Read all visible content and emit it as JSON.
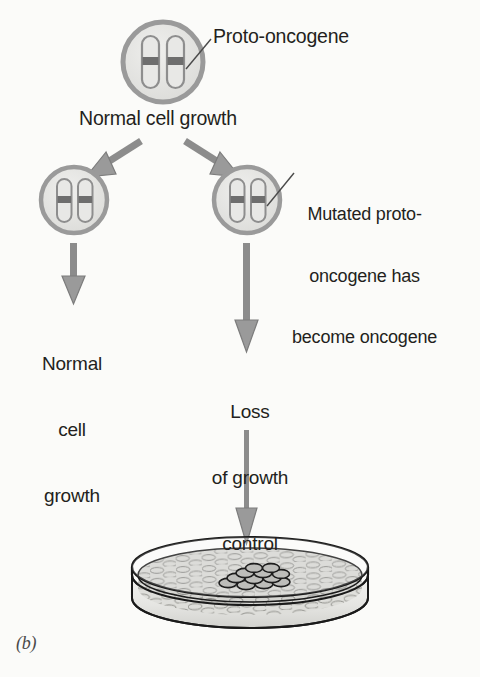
{
  "figure": {
    "panel_letter": "(b)",
    "background_color": "#fbfbf9",
    "text_color": "#231f20",
    "arrow_color": "#8b8b8b",
    "cell_membrane_color": "#9a9a9a",
    "cell_interior_color": "#e3e3e1",
    "chromosome_outline_color": "#8e8e8e",
    "gene_band_color": "#6e6e6e",
    "dish_outline_color": "#1a1a1a",
    "dish_fill_color": "#d7d7d4",
    "focus_cell_color": "#2b2b2b"
  },
  "labels": {
    "proto_oncogene": "Proto-oncogene",
    "normal_cell_growth": "Normal cell growth",
    "mutated_line1": "Mutated proto-",
    "mutated_line2": "oncogene has",
    "mutated_line3": "become oncogene",
    "left_outcome_line1": "Normal",
    "left_outcome_line2": "cell",
    "left_outcome_line3": "growth",
    "right_outcome_line1": "Loss",
    "right_outcome_line2": "of growth",
    "right_outcome_line3": "control"
  },
  "cells": {
    "top": {
      "name": "normal-cell-with-proto-oncogene",
      "cx": 163,
      "cy": 62,
      "r": 40,
      "chromosome_count": 2,
      "gene_band": "proto-oncogene"
    },
    "left": {
      "name": "normal-daughter-cell",
      "cx": 74,
      "cy": 200,
      "r": 33,
      "chromosome_count": 2,
      "gene_band": "proto-oncogene"
    },
    "right": {
      "name": "mutated-daughter-cell",
      "cx": 247,
      "cy": 200,
      "r": 33,
      "chromosome_count": 2,
      "gene_band": "oncogene"
    }
  },
  "dish": {
    "name": "petri-dish-with-transformed-focus",
    "cx": 250,
    "cy": 575,
    "rx": 118,
    "ry": 30,
    "wall_height": 44,
    "monolayer_description": "flat confluent cell monolayer",
    "focus_description": "dark piled-up clump of transformed cells"
  },
  "arrows": [
    {
      "name": "branch-arrow-left",
      "from": [
        140,
        140
      ],
      "to": [
        90,
        172
      ]
    },
    {
      "name": "branch-arrow-right",
      "from": [
        186,
        140
      ],
      "to": [
        232,
        172
      ]
    },
    {
      "name": "arrow-left-to-outcome",
      "from": [
        74,
        241
      ],
      "to": [
        74,
        300
      ]
    },
    {
      "name": "arrow-right-to-outcome",
      "from": [
        247,
        241
      ],
      "to": [
        247,
        348
      ]
    },
    {
      "name": "arrow-to-dish",
      "from": [
        247,
        428
      ],
      "to": [
        247,
        540
      ]
    }
  ],
  "leader_lines": [
    {
      "name": "leader-proto-oncogene",
      "from": [
        186,
        68
      ],
      "to": [
        212,
        38
      ]
    },
    {
      "name": "leader-mutated-oncogene",
      "from": [
        268,
        203
      ],
      "to": [
        296,
        172
      ]
    }
  ]
}
